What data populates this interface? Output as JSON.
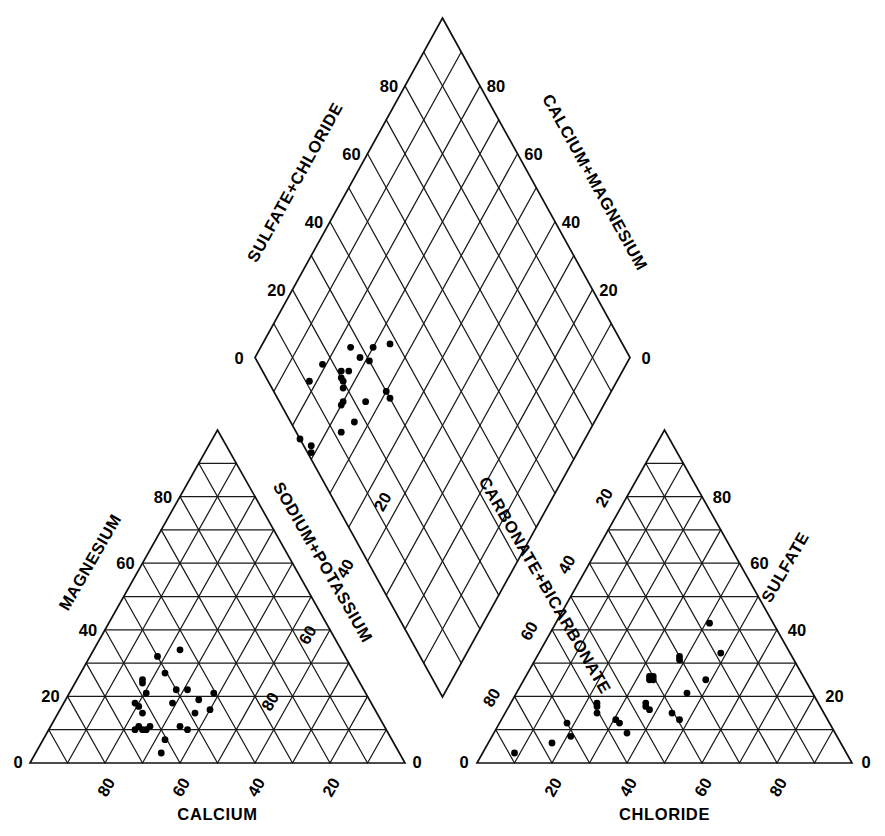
{
  "figure": {
    "kind": "piper-trilinear-diagram",
    "background_color": "#ffffff",
    "line_color": "#1a1a1a",
    "point_color": "#000000",
    "title": ""
  },
  "chart_data": {
    "type": "scatter",
    "title": "",
    "xlabel": "",
    "ylabel": "",
    "grid": true,
    "legend": "none",
    "axis_range": [
      0,
      100
    ],
    "tick_values": [
      0,
      20,
      40,
      60,
      80
    ],
    "panels": [
      {
        "id": "cation-triangle",
        "name": "Cation ternary (lower-left)",
        "position": "lower-left",
        "axes": [
          {
            "id": "calcium",
            "label": "CALCIUM",
            "side": "bottom",
            "ticks": [
              0,
              20,
              40,
              60,
              80
            ],
            "tick_labels": [
              "0",
              "20",
              "40",
              "60",
              "80"
            ],
            "direction": "right-to-left"
          },
          {
            "id": "magnesium",
            "label": "MAGNESIUM",
            "side": "left",
            "ticks": [
              0,
              20,
              40,
              60,
              80
            ],
            "tick_labels": [
              "0",
              "20",
              "40",
              "60",
              "80"
            ],
            "direction": "bottom-to-top"
          },
          {
            "id": "sodium-potassium",
            "label": "SODIUM+POTASSIUM",
            "side": "right",
            "ticks": [
              0,
              20,
              40,
              60,
              80
            ],
            "tick_labels": [
              "0",
              "20",
              "40",
              "60",
              "80"
            ],
            "direction": "top-to-bottom"
          }
        ],
        "points": [
          {
            "ca": 66,
            "mg": 32,
            "na": 2
          },
          {
            "ca": 60,
            "mg": 34,
            "na": 6
          },
          {
            "ca": 70,
            "mg": 25,
            "na": 5
          },
          {
            "ca": 70,
            "mg": 24,
            "na": 6
          },
          {
            "ca": 69,
            "mg": 21,
            "na": 10
          },
          {
            "ca": 64,
            "mg": 27,
            "na": 9
          },
          {
            "ca": 61,
            "mg": 22,
            "na": 17
          },
          {
            "ca": 58,
            "mg": 22,
            "na": 20
          },
          {
            "ca": 55,
            "mg": 19,
            "na": 26
          },
          {
            "ca": 51,
            "mg": 21,
            "na": 28
          },
          {
            "ca": 72,
            "mg": 18,
            "na": 10
          },
          {
            "ca": 71,
            "mg": 17,
            "na": 12
          },
          {
            "ca": 62,
            "mg": 18,
            "na": 20
          },
          {
            "ca": 56,
            "mg": 15,
            "na": 29
          },
          {
            "ca": 52,
            "mg": 16,
            "na": 32
          },
          {
            "ca": 70,
            "mg": 15,
            "na": 15
          },
          {
            "ca": 71,
            "mg": 11,
            "na": 18
          },
          {
            "ca": 70,
            "mg": 10,
            "na": 20
          },
          {
            "ca": 69,
            "mg": 10,
            "na": 21
          },
          {
            "ca": 68,
            "mg": 11,
            "na": 21
          },
          {
            "ca": 72,
            "mg": 10,
            "na": 18
          },
          {
            "ca": 60,
            "mg": 11,
            "na": 29
          },
          {
            "ca": 58,
            "mg": 10,
            "na": 32
          },
          {
            "ca": 64,
            "mg": 7,
            "na": 29
          },
          {
            "ca": 65,
            "mg": 3,
            "na": 32
          }
        ]
      },
      {
        "id": "anion-triangle",
        "name": "Anion ternary (lower-right)",
        "position": "lower-right",
        "axes": [
          {
            "id": "chloride",
            "label": "CHLORIDE",
            "side": "bottom",
            "ticks": [
              0,
              20,
              40,
              60,
              80
            ],
            "tick_labels": [
              "0",
              "20",
              "40",
              "60",
              "80"
            ],
            "direction": "left-to-right"
          },
          {
            "id": "sulfate",
            "label": "SULFATE",
            "side": "right",
            "ticks": [
              0,
              20,
              40,
              60,
              80
            ],
            "tick_labels": [
              "0",
              "20",
              "40",
              "60",
              "80"
            ],
            "direction": "bottom-to-top"
          },
          {
            "id": "carbonate-bicarbonate",
            "label": "CARBONATE+BICARBONATE",
            "side": "left",
            "ticks": [
              0,
              20,
              40,
              60,
              80
            ],
            "tick_labels": [
              "0",
              "20",
              "40",
              "60",
              "80"
            ],
            "direction": "top-to-bottom"
          }
        ],
        "points": [
          {
            "cl": 22,
            "so4": 32,
            "hco3": 46
          },
          {
            "cl": 23,
            "so4": 31,
            "hco3": 46
          },
          {
            "cl": 32,
            "so4": 33,
            "hco3": 35
          },
          {
            "cl": 20,
            "so4": 26,
            "hco3": 54
          },
          {
            "cl": 21,
            "so4": 25,
            "hco3": 54
          },
          {
            "cl": 21,
            "so4": 26,
            "hco3": 53
          },
          {
            "cl": 22,
            "so4": 25,
            "hco3": 53
          },
          {
            "cl": 36,
            "so4": 25,
            "hco3": 39
          },
          {
            "cl": 35,
            "so4": 21,
            "hco3": 44
          },
          {
            "cl": 27,
            "so4": 18,
            "hco3": 55
          },
          {
            "cl": 28,
            "so4": 17,
            "hco3": 55
          },
          {
            "cl": 30,
            "so4": 16,
            "hco3": 54
          },
          {
            "cl": 14,
            "so4": 18,
            "hco3": 68
          },
          {
            "cl": 15,
            "so4": 17,
            "hco3": 68
          },
          {
            "cl": 17,
            "so4": 15,
            "hco3": 68
          },
          {
            "cl": 37,
            "so4": 15,
            "hco3": 48
          },
          {
            "cl": 41,
            "so4": 13,
            "hco3": 46
          },
          {
            "cl": 14,
            "so4": 6,
            "hco3": 80
          },
          {
            "cl": 7,
            "so4": 3,
            "hco3": 90
          },
          {
            "cl": 24,
            "so4": 13,
            "hco3": 63
          },
          {
            "cl": 26,
            "so4": 12,
            "hco3": 62
          },
          {
            "cl": 12,
            "so4": 12,
            "hco3": 76
          },
          {
            "cl": 31,
            "so4": 9,
            "hco3": 60
          },
          {
            "cl": 17,
            "so4": 8,
            "hco3": 75
          },
          {
            "cl": 20,
            "so4": 42,
            "hco3": 38
          }
        ]
      },
      {
        "id": "diamond",
        "name": "Combined diamond field (upper)",
        "position": "top-center",
        "axes": [
          {
            "id": "sulfate-chloride",
            "label": "SULFATE+CHLORIDE",
            "side": "upper-left",
            "ticks": [
              0,
              20,
              40,
              60,
              80
            ],
            "tick_labels": [
              "0",
              "20",
              "40",
              "60",
              "80"
            ],
            "direction": "bottom-to-top"
          },
          {
            "id": "calcium-magnesium",
            "label": "CALCIUM+MAGNESIUM",
            "side": "upper-right",
            "ticks": [
              0,
              20,
              40,
              60,
              80
            ],
            "tick_labels": [
              "0",
              "20",
              "40",
              "60",
              "80"
            ],
            "direction": "bottom-to-top"
          }
        ],
        "points": [
          {
            "camg": 34,
            "socl": 38
          },
          {
            "camg": 30,
            "socl": 33
          },
          {
            "camg": 31,
            "socl": 30
          },
          {
            "camg": 24,
            "socl": 27
          },
          {
            "camg": 28,
            "socl": 28
          },
          {
            "camg": 40,
            "socl": 30
          },
          {
            "camg": 42,
            "socl": 30
          },
          {
            "camg": 27,
            "socl": 23
          },
          {
            "camg": 36,
            "socl": 23
          },
          {
            "camg": 25,
            "socl": 21
          },
          {
            "camg": 26,
            "socl": 20
          },
          {
            "camg": 27,
            "socl": 20
          },
          {
            "camg": 28,
            "socl": 19
          },
          {
            "camg": 30,
            "socl": 17
          },
          {
            "camg": 30,
            "socl": 16
          },
          {
            "camg": 36,
            "socl": 17
          },
          {
            "camg": 19,
            "socl": 17
          },
          {
            "camg": 34,
            "socl": 12
          },
          {
            "camg": 18,
            "socl": 11
          },
          {
            "camg": 28,
            "socl": 2
          },
          {
            "camg": 29,
            "socl": 1
          },
          {
            "camg": 24,
            "socl": 0
          }
        ]
      }
    ]
  },
  "labels": {
    "diamond": {
      "left_axis": "SULFATE+CHLORIDE",
      "right_axis": "CALCIUM+MAGNESIUM",
      "left_ticks": [
        "0",
        "20",
        "40",
        "60",
        "80"
      ],
      "right_ticks": [
        "0",
        "20",
        "40",
        "60",
        "80"
      ]
    },
    "left_triangle": {
      "bottom_axis": "CALCIUM",
      "left_axis": "MAGNESIUM",
      "right_axis": "SODIUM+POTASSIUM",
      "bottom_ticks": [
        "0",
        "80",
        "60",
        "40",
        "20",
        "0"
      ],
      "left_ticks": [
        "0",
        "20",
        "40",
        "60",
        "80",
        "0"
      ],
      "right_ticks": [
        "20",
        "40",
        "60",
        "80"
      ]
    },
    "right_triangle": {
      "bottom_axis": "CHLORIDE",
      "left_axis": "CARBONATE+BICARBONATE",
      "right_axis": "SULFATE",
      "bottom_ticks": [
        "0",
        "20",
        "40",
        "60",
        "80",
        "0"
      ],
      "left_ticks": [
        "0",
        "20",
        "40",
        "60",
        "80"
      ],
      "right_ticks": [
        "80",
        "60",
        "40",
        "20",
        "0"
      ]
    }
  }
}
